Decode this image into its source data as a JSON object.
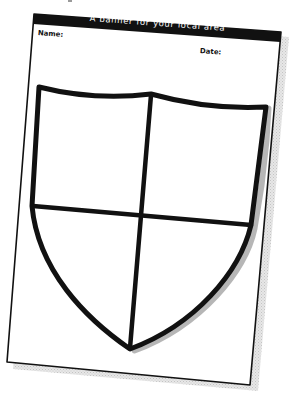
{
  "worksheet": {
    "title": "A banner for your local area",
    "fields": {
      "name_label": "Name:",
      "date_label": "Date:"
    },
    "template": {
      "shape": "shield",
      "divisions": "quartered (cross)",
      "quadrants": 4
    }
  },
  "colors": {
    "background": "#ffffff",
    "paper": "#ffffff",
    "ink": "#111111",
    "header_bar": "#111111",
    "header_text": "#ffffff",
    "shadow": "#d2d2d2"
  }
}
